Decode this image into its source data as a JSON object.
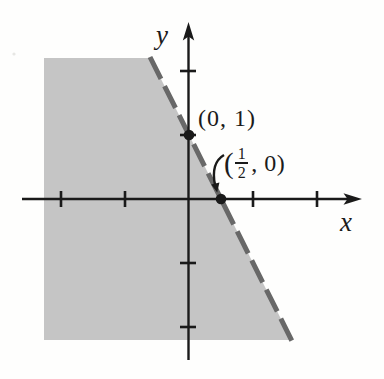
{
  "figure": {
    "background_color": "#fefefd",
    "axis_color": "#1a1a1a",
    "shade_color": "#c5c5c5",
    "dash_color": "#686868",
    "x_axis_label": "x",
    "y_axis_label": "y",
    "point2_label_parts": {
      "open": "(",
      "numerator": "1",
      "denominator": "2",
      "close": ", 0)"
    }
  },
  "chart_data": {
    "type": "area",
    "title": "",
    "xlabel": "x",
    "ylabel": "y",
    "xlim": [
      -2.6,
      2.7
    ],
    "ylim": [
      -2.8,
      2.75
    ],
    "x_ticks": [
      -2,
      -1,
      1,
      2
    ],
    "y_ticks": [
      -2,
      -1,
      1,
      2
    ],
    "tick_labels_shown": false,
    "grid": false,
    "boundary_line": {
      "style": "dashed",
      "inclusive": false,
      "slope": -2,
      "y_intercept": 1,
      "points": [
        {
          "x": 0,
          "y": 1
        },
        {
          "x": 0.5,
          "y": 0
        }
      ]
    },
    "marked_points": [
      {
        "x": 0,
        "y": 1,
        "label": "(0, 1)"
      },
      {
        "x": 0.5,
        "y": 0,
        "label": "(1/2, 0)"
      }
    ],
    "shaded_region": {
      "side": "below-left of boundary line",
      "inequality": "2x + y < 1",
      "fill": "#c5c5c5"
    }
  }
}
